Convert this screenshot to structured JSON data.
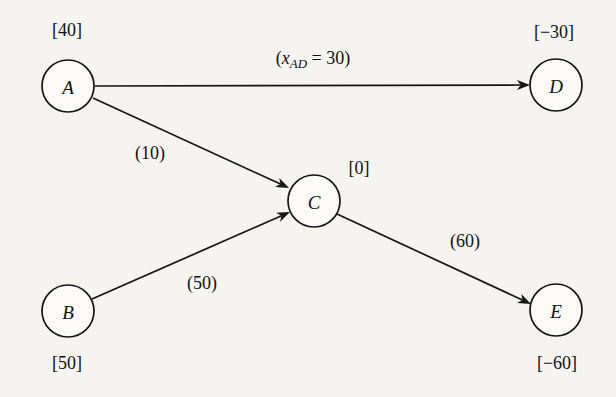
{
  "figure": {
    "kind": "network-flow-diagram",
    "background_color": "#f6f4f1",
    "ink_color": "#141414",
    "width": 616,
    "height": 397
  },
  "nodes": [
    {
      "id": "A",
      "label": "A",
      "supply_label": "[40]",
      "supply_value": 40,
      "cx": 68,
      "cy": 86,
      "r": 26,
      "supply_x": 67,
      "supply_y": 30
    },
    {
      "id": "B",
      "label": "B",
      "supply_label": "[50]",
      "supply_value": 50,
      "cx": 68,
      "cy": 311,
      "r": 26,
      "supply_x": 67,
      "supply_y": 363
    },
    {
      "id": "C",
      "label": "C",
      "supply_label": "[0]",
      "supply_value": 0,
      "cx": 314,
      "cy": 201,
      "r": 26,
      "supply_x": 359,
      "supply_y": 168
    },
    {
      "id": "D",
      "label": "D",
      "supply_label": "[−30]",
      "supply_value": -30,
      "cx": 556,
      "cy": 85,
      "r": 26,
      "supply_x": 554,
      "supply_y": 32
    },
    {
      "id": "E",
      "label": "E",
      "supply_label": "[−60]",
      "supply_value": -60,
      "cx": 556,
      "cy": 310,
      "r": 26,
      "supply_x": 557,
      "supply_y": 363
    }
  ],
  "edges": [
    {
      "id": "A-D",
      "from": "A",
      "to": "D",
      "x1": 95,
      "y1": 86,
      "x2": 530,
      "y2": 85,
      "label_prefix": "(",
      "label_var": "x",
      "label_sub": "AD",
      "label_suffix": " = 30)",
      "label_text": "(x_AD = 30)",
      "flow_value": 30,
      "label_x": 313,
      "label_y": 58
    },
    {
      "id": "A-C",
      "from": "A",
      "to": "C",
      "x1": 93,
      "y1": 98,
      "x2": 289,
      "y2": 188,
      "label_text": "(10)",
      "cost_value": 10,
      "label_x": 150,
      "label_y": 153
    },
    {
      "id": "B-C",
      "from": "B",
      "to": "C",
      "x1": 92,
      "y1": 299,
      "x2": 290,
      "y2": 212,
      "label_text": "(50)",
      "cost_value": 50,
      "label_x": 202,
      "label_y": 283
    },
    {
      "id": "C-E",
      "from": "C",
      "to": "E",
      "x1": 337,
      "y1": 214,
      "x2": 531,
      "y2": 304,
      "label_text": "(60)",
      "cost_value": 60,
      "label_x": 465,
      "label_y": 241
    }
  ]
}
